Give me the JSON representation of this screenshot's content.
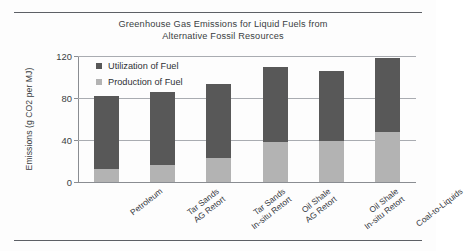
{
  "chart_data": {
    "type": "bar",
    "subtype": "stacked",
    "title": "Greenhouse Gas Emissions for Liquid Fuels from Alternative Fossil Resources",
    "title_lines": [
      "Greenhouse Gas Emissions for Liquid Fuels from",
      "Alternative Fossil Resources"
    ],
    "xlabel": "",
    "ylabel": "Emissions (g CO2 per MJ)",
    "ylim": [
      0,
      120
    ],
    "yticks": [
      0,
      40,
      80,
      120
    ],
    "ytick_labels": [
      "0",
      "40",
      "80",
      "120"
    ],
    "grid": true,
    "grid_axis": "y",
    "legend_position": "upper left inside",
    "categories": [
      "Petroleum",
      "Tar Sands AG Retort",
      "Tar Sands In-situ Retort",
      "Oil Shale AG Retort",
      "Oil Shale In-situ Retort",
      "Coal-to-Liquids"
    ],
    "category_lines": [
      [
        "Petroleum",
        ""
      ],
      [
        "Tar Sands",
        "AG Retort"
      ],
      [
        "Tar Sands",
        "In-situ Retort"
      ],
      [
        "Oil Shale",
        "AG Retort"
      ],
      [
        "Oil Shale",
        "In-situ Retort"
      ],
      [
        "Coal-to-Liquids",
        ""
      ]
    ],
    "series": [
      {
        "name": "Production of Fuel",
        "color": "#b3b3b3",
        "values": [
          12,
          16,
          23,
          38,
          39,
          48
        ]
      },
      {
        "name": "Utilization of Fuel",
        "color": "#585858",
        "values": [
          70,
          70,
          70,
          72,
          67,
          70
        ]
      }
    ],
    "totals": [
      82,
      86,
      93,
      110,
      106,
      118
    ]
  },
  "legend": {
    "items": [
      {
        "label": "Utilization of Fuel",
        "color": "#585858"
      },
      {
        "label": "Production of Fuel",
        "color": "#b3b3b3"
      }
    ]
  }
}
